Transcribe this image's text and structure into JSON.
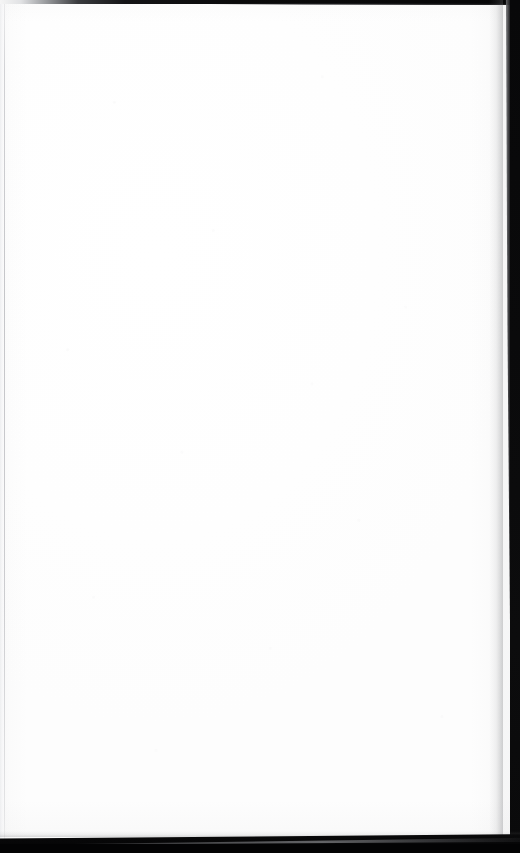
{
  "document": {
    "kind": "scanned-page",
    "page_label": "",
    "body_text": "",
    "is_blank": true,
    "width_px": 520,
    "height_px": 853
  },
  "page": {
    "surface_color": "#ffffff",
    "paper_tone": "#fefefe",
    "content_text": ""
  },
  "scan_artifacts": {
    "top_border": {
      "name": "top-dark-edge",
      "color": "#0a0a0b",
      "thickness_px": 4,
      "fades_toward": "left"
    },
    "left_edge": {
      "name": "left-page-hairline",
      "color": "#b6b7bc",
      "thickness_px": 1,
      "offset_px": 4
    },
    "right_band": {
      "name": "right-dark-band",
      "color": "#0a0a0b",
      "start_x_px": 503,
      "width_px": 17,
      "taper": "narrows toward bottom"
    },
    "bottom_band": {
      "name": "bottom-black-band",
      "color": "#040405",
      "start_y_px": 838,
      "height_px": 15,
      "edge": "diagonal, rising left to right",
      "wedge_color": "#8a8b8f"
    }
  }
}
